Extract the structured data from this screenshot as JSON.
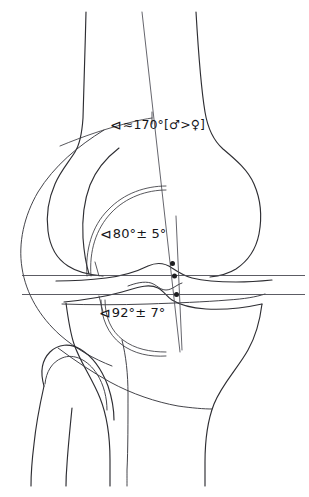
{
  "figure": {
    "background_color": "#ffffff",
    "line_color": "#2e2e33"
  },
  "annotations": [
    {
      "id": "femoral-shaft-angle",
      "glyph": "⊲",
      "text": "≈170°[♂>♀]",
      "value": 170,
      "unit": "°",
      "approximate": true,
      "note": "male greater than female"
    },
    {
      "id": "lateral-distal-femoral-angle",
      "glyph": "⊲",
      "text": "80°± 5°",
      "value": 80,
      "tolerance": 5,
      "unit": "°"
    },
    {
      "id": "medial-proximal-tibial-angle",
      "glyph": "⊲",
      "text": "92°± 7°",
      "value": 92,
      "tolerance": 7,
      "unit": "°"
    }
  ],
  "structures": [
    {
      "id": "femur",
      "label": "femur"
    },
    {
      "id": "femoral-condyles",
      "label": "femoral condyles"
    },
    {
      "id": "tibia",
      "label": "tibia"
    },
    {
      "id": "tibial-plateau",
      "label": "tibial plateau"
    },
    {
      "id": "fibula",
      "label": "fibula"
    },
    {
      "id": "patella-outline",
      "label": "patella outline"
    }
  ],
  "reference_lines": [
    {
      "id": "joint-line-femoral",
      "orientation": "horizontal"
    },
    {
      "id": "joint-line-tibial",
      "orientation": "horizontal"
    },
    {
      "id": "femoral-mechanical-axis",
      "orientation": "vertical"
    },
    {
      "id": "tibial-mechanical-axis",
      "orientation": "vertical"
    }
  ]
}
